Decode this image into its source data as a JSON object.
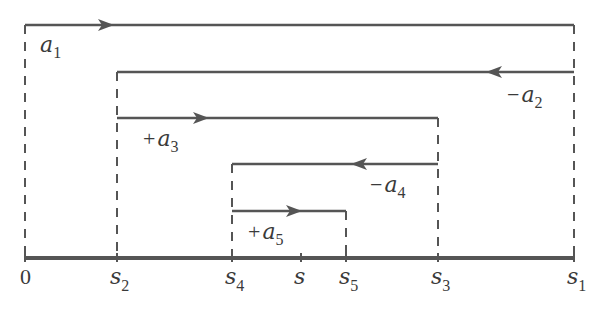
{
  "diagram": {
    "colors": {
      "line": "#555555",
      "text": "#3a3a3a",
      "background": "#ffffff"
    },
    "axis": {
      "y": 258,
      "x_start": 25,
      "x_end": 574,
      "ticks": [
        {
          "id": "zero",
          "x": 25,
          "label": "0",
          "sub": ""
        },
        {
          "id": "s2",
          "x": 117,
          "label": "s",
          "sub": "2"
        },
        {
          "id": "s4",
          "x": 232,
          "label": "s",
          "sub": "4"
        },
        {
          "id": "s",
          "x": 301,
          "label": "s",
          "sub": ""
        },
        {
          "id": "s5",
          "x": 346,
          "label": "s",
          "sub": "5"
        },
        {
          "id": "s3",
          "x": 438,
          "label": "s",
          "sub": "3"
        },
        {
          "id": "s1",
          "x": 574,
          "label": "s",
          "sub": "1"
        }
      ]
    },
    "segments": [
      {
        "id": "a1",
        "sign": "",
        "name": "a",
        "sub": "1",
        "y": 25,
        "x1": 25,
        "x2": 574,
        "arrow_x": 110,
        "direction": "right",
        "label_x": 40,
        "label_y": 52
      },
      {
        "id": "a2",
        "sign": "−",
        "name": "a",
        "sub": "2",
        "y": 72,
        "x1": 117,
        "x2": 574,
        "arrow_x": 490,
        "direction": "left",
        "label_x": 507,
        "label_y": 102
      },
      {
        "id": "a3",
        "sign": "+",
        "name": "a",
        "sub": "3",
        "y": 118,
        "x1": 117,
        "x2": 438,
        "arrow_x": 205,
        "direction": "right",
        "label_x": 143,
        "label_y": 146
      },
      {
        "id": "a4",
        "sign": "−",
        "name": "a",
        "sub": "4",
        "y": 164,
        "x1": 232,
        "x2": 438,
        "arrow_x": 355,
        "direction": "left",
        "label_x": 370,
        "label_y": 192
      },
      {
        "id": "a5",
        "sign": "+",
        "name": "a",
        "sub": "5",
        "y": 211,
        "x1": 232,
        "x2": 346,
        "arrow_x": 298,
        "direction": "right",
        "label_x": 248,
        "label_y": 239
      }
    ],
    "dashed_verticals": [
      {
        "x": 25,
        "y1": 25,
        "y2": 258
      },
      {
        "x": 117,
        "y1": 72,
        "y2": 258
      },
      {
        "x": 232,
        "y1": 164,
        "y2": 258
      },
      {
        "x": 346,
        "y1": 211,
        "y2": 258
      },
      {
        "x": 438,
        "y1": 118,
        "y2": 258
      },
      {
        "x": 574,
        "y1": 25,
        "y2": 258
      }
    ]
  }
}
